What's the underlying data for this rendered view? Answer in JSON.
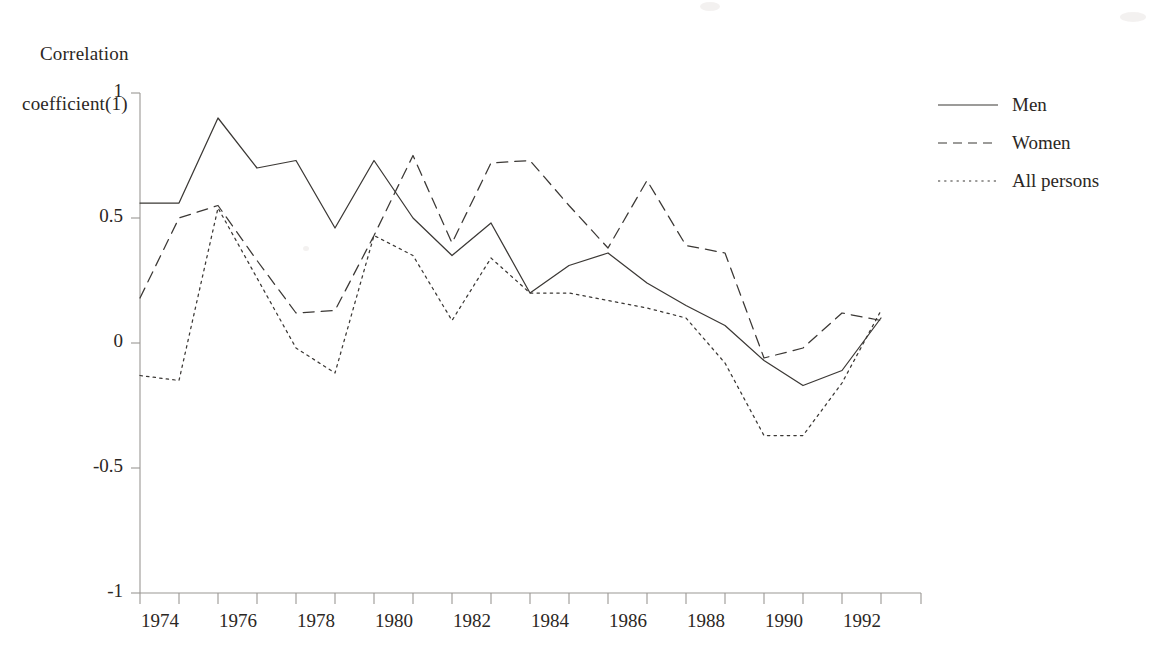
{
  "chart_data": {
    "type": "line",
    "title": "",
    "xlabel": "",
    "ylabel": "Correlation coefficient(1)",
    "ylabel_line1": "Correlation",
    "ylabel_line2": "coefficient(1)",
    "xlim": [
      1974,
      1993.6
    ],
    "ylim": [
      -1,
      1
    ],
    "grid": false,
    "legend_position": "right",
    "x": [
      1974,
      1975,
      1976,
      1977,
      1978,
      1979,
      1980,
      1981,
      1982,
      1983,
      1984,
      1985,
      1986,
      1987,
      1988,
      1989,
      1990,
      1991,
      1992,
      1993
    ],
    "y_ticks": [
      1,
      0.5,
      0,
      -0.5,
      -1
    ],
    "y_tick_labels": [
      "1",
      "0.5",
      "0",
      "-0.5",
      "-1"
    ],
    "x_ticks": [
      1974,
      1975,
      1976,
      1977,
      1978,
      1979,
      1980,
      1981,
      1982,
      1983,
      1984,
      1985,
      1986,
      1987,
      1988,
      1989,
      1990,
      1991,
      1992,
      1993
    ],
    "x_tick_labels": [
      "1974",
      "",
      "1976",
      "",
      "1978",
      "",
      "1980",
      "",
      "1982",
      "",
      "1984",
      "",
      "1986",
      "",
      "1988",
      "",
      "1990",
      "",
      "1992",
      ""
    ],
    "x_labels_shown": [
      "1974",
      "1976",
      "1978",
      "1980",
      "1982",
      "1984",
      "1986",
      "1988",
      "1990",
      "1992"
    ],
    "series": [
      {
        "name": "Men",
        "style": "solid",
        "color": "#3b3835",
        "values": [
          0.56,
          0.56,
          0.9,
          0.7,
          0.73,
          0.46,
          0.73,
          0.5,
          0.35,
          0.48,
          0.2,
          0.31,
          0.36,
          0.24,
          0.15,
          0.07,
          -0.07,
          -0.17,
          -0.11,
          0.1
        ]
      },
      {
        "name": "Women",
        "style": "dashed",
        "color": "#3b3835",
        "values": [
          0.18,
          0.5,
          0.55,
          0.33,
          0.12,
          0.13,
          0.43,
          0.75,
          0.4,
          0.72,
          0.73,
          0.55,
          0.38,
          0.65,
          0.39,
          0.36,
          -0.06,
          -0.02,
          0.12,
          0.09
        ]
      },
      {
        "name": "All persons",
        "style": "dotted",
        "color": "#3b3835",
        "values": [
          -0.13,
          -0.15,
          0.54,
          0.26,
          -0.02,
          -0.12,
          0.43,
          0.35,
          0.09,
          0.34,
          0.2,
          0.2,
          0.17,
          0.14,
          0.1,
          -0.08,
          -0.37,
          -0.37,
          -0.16,
          0.13
        ]
      }
    ]
  },
  "legend": {
    "items": [
      {
        "label": "Men",
        "style": "solid"
      },
      {
        "label": "Women",
        "style": "dashed"
      },
      {
        "label": "All persons",
        "style": "dotted"
      }
    ]
  }
}
